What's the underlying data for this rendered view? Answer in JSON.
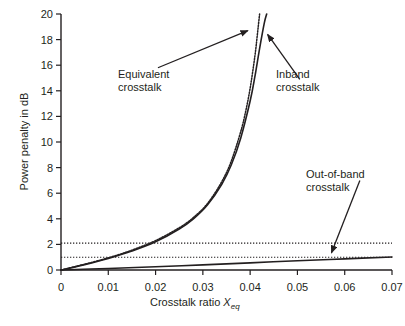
{
  "chart_data": {
    "type": "line",
    "title": "",
    "xlabel": "Crosstalk ratio Xeq",
    "ylabel": "Power penalty in dB",
    "xlim": [
      0,
      0.07
    ],
    "ylim": [
      0,
      20
    ],
    "grid": false,
    "legend_position": "annotations",
    "x_ticks": [
      "0",
      "0.01",
      "0.02",
      "0.03",
      "0.04",
      "0.05",
      "0.06",
      "0.07"
    ],
    "x_tick_values": [
      0,
      0.01,
      0.02,
      0.03,
      0.04,
      0.05,
      0.06,
      0.07
    ],
    "y_ticks": [
      "0",
      "2",
      "4",
      "6",
      "8",
      "10",
      "12",
      "14",
      "16",
      "18",
      "20"
    ],
    "y_tick_values": [
      0,
      2,
      4,
      6,
      8,
      10,
      12,
      14,
      16,
      18,
      20
    ],
    "series": [
      {
        "name": "Equivalent crosstalk",
        "style": "dotted",
        "color": "#231f20",
        "x": [
          0,
          0.005,
          0.01,
          0.015,
          0.02,
          0.025,
          0.028,
          0.031,
          0.034,
          0.036,
          0.038,
          0.039,
          0.04,
          0.041,
          0.0415,
          0.042
        ],
        "values": [
          0,
          0.45,
          0.95,
          1.55,
          2.3,
          3.3,
          4.1,
          5.2,
          6.9,
          8.5,
          10.8,
          12.3,
          14.2,
          16.7,
          18.3,
          20.0
        ]
      },
      {
        "name": "Inband crosstalk",
        "style": "solid",
        "color": "#231f20",
        "x": [
          0,
          0.005,
          0.01,
          0.015,
          0.02,
          0.025,
          0.028,
          0.031,
          0.034,
          0.036,
          0.038,
          0.04,
          0.041,
          0.042,
          0.043,
          0.0435
        ],
        "values": [
          0,
          0.42,
          0.9,
          1.48,
          2.2,
          3.2,
          4.0,
          5.1,
          6.7,
          8.2,
          10.3,
          13.2,
          15.1,
          17.3,
          19.3,
          20.0
        ]
      },
      {
        "name": "Out-of-band crosstalk",
        "style": "solid",
        "color": "#231f20",
        "x": [
          0,
          0.01,
          0.02,
          0.03,
          0.04,
          0.05,
          0.06,
          0.07
        ],
        "values": [
          0,
          0.12,
          0.25,
          0.4,
          0.56,
          0.72,
          0.87,
          1.02
        ]
      }
    ],
    "reference_lines": [
      {
        "name": "upper-threshold",
        "value": 2.1,
        "style": "dotted"
      },
      {
        "name": "lower-threshold",
        "value": 1.0,
        "style": "dotted"
      }
    ],
    "annotations": [
      {
        "name": "equivalent-crosstalk",
        "line1": "Equivalent",
        "line2": "crosstalk",
        "arrow_from": [
          0.0205,
          15.8
        ],
        "arrow_to": [
          0.0395,
          18.7
        ]
      },
      {
        "name": "inband-crosstalk",
        "line1": "Inband",
        "line2": "crosstalk",
        "arrow_from": [
          0.0505,
          14.9
        ],
        "arrow_to": [
          0.0437,
          18.4
        ]
      },
      {
        "name": "out-of-band-crosstalk",
        "line1": "Out-of-band",
        "line2": "crosstalk",
        "arrow_from": [
          0.0632,
          7.0
        ],
        "arrow_to": [
          0.0572,
          1.35
        ]
      }
    ]
  },
  "figure": {
    "caption_number": "",
    "caption_text": ""
  }
}
